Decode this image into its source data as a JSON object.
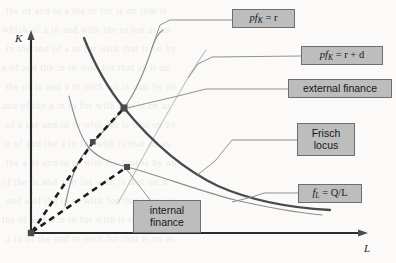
{
  "figure": {
    "name": "frisch-locus-diagram",
    "axes": {
      "y_label": "K",
      "x_label": "L",
      "y_title": "capital",
      "x_title": "labour"
    },
    "labels": {
      "pfk_r": {
        "lead": "pf",
        "sub": "K",
        "rest": " = r"
      },
      "pfk_r_plus_d": {
        "lead": "pf",
        "sub": "K",
        "rest": " = r + d"
      },
      "external_finance": "external finance",
      "frisch_locus_line1": "Frisch",
      "frisch_locus_line2": "locus",
      "fl_ql": {
        "lead": "f",
        "sub": "L",
        "rest": " = Q/L"
      },
      "internal_finance_line1": "internal",
      "internal_finance_line2": "finance"
    },
    "colors": {
      "box_fill": "#bdbdbd",
      "box_border": "#6e6e6e",
      "axis": "#2b2b2b",
      "curve_thick": "#4a4a4a",
      "curve_thin": "#8c8c8c",
      "curve_faint": "#c2c2c2",
      "ray_dashed": "#1d1d1d",
      "background": "#fbfaf8"
    },
    "nodes": [
      {
        "name": "external-finance-point",
        "x": 124,
        "y": 108
      },
      {
        "name": "mid-crossing-point",
        "x": 93,
        "y": 142
      },
      {
        "name": "internal-finance-point",
        "x": 127,
        "y": 167
      },
      {
        "name": "origin-point",
        "x": 31,
        "y": 233
      }
    ]
  },
  "chart_data": {
    "type": "line",
    "title": "",
    "xlabel": "L",
    "ylabel": "K",
    "grid": false,
    "legend": "callout-boxes",
    "xlim": [
      0,
      396
    ],
    "ylim": [
      0,
      263
    ],
    "series": [
      {
        "name": "Frisch locus",
        "style": "thick-dark",
        "note": "downward-sloping convex isoquant-like curve through external finance point",
        "points": [
          [
            84,
            38
          ],
          [
            95,
            56
          ],
          [
            108,
            80
          ],
          [
            124,
            108
          ],
          [
            142,
            133
          ],
          [
            165,
            156
          ],
          [
            196,
            176
          ],
          [
            235,
            192
          ],
          [
            280,
            203
          ],
          [
            330,
            209
          ]
        ]
      },
      {
        "name": "pf_K = r",
        "style": "thin-grey",
        "note": "upward S-shaped curve rising to upper right",
        "points": [
          [
            65,
            205
          ],
          [
            72,
            180
          ],
          [
            80,
            158
          ],
          [
            92,
            143
          ],
          [
            108,
            126
          ],
          [
            124,
            108
          ],
          [
            137,
            86
          ],
          [
            148,
            62
          ],
          [
            154,
            40
          ],
          [
            163,
            31
          ]
        ]
      },
      {
        "name": "pf_K = r + d",
        "style": "faint-grey",
        "note": "faint upward curve to the right of pf_K = r",
        "points": [
          [
            118,
            203
          ],
          [
            131,
            178
          ],
          [
            146,
            152
          ],
          [
            160,
            128
          ],
          [
            174,
            104
          ],
          [
            188,
            80
          ],
          [
            199,
            62
          ],
          [
            206,
            50
          ]
        ]
      },
      {
        "name": "f_L = Q/L",
        "style": "thin-grey",
        "note": "lower downward-sloping curve through internal finance point",
        "points": [
          [
            69,
            96
          ],
          [
            82,
            126
          ],
          [
            97,
            150
          ],
          [
            115,
            162
          ],
          [
            127,
            167
          ],
          [
            155,
            181
          ],
          [
            190,
            193
          ],
          [
            232,
            202
          ],
          [
            275,
            210
          ],
          [
            320,
            215
          ]
        ]
      },
      {
        "name": "internal finance ray",
        "style": "dashed",
        "note": "dashed ray from origin to internal finance point",
        "points": [
          [
            31,
            233
          ],
          [
            127,
            167
          ]
        ]
      },
      {
        "name": "external finance ray",
        "style": "dashed",
        "note": "dashed ray from origin through mid crossing to external finance point",
        "points": [
          [
            31,
            233
          ],
          [
            93,
            142
          ],
          [
            124,
            108
          ]
        ]
      }
    ]
  },
  "background_text": {
    "note": "faint show-through text from reverse of scanned page",
    "lines": [
      "the  of  and  in  a  the  to  for  is  on  that  it",
      "which  of  a  in  and  with  the  to  but  as  an",
      "in  the  and  of  a  to  for  with  that  is  on  by",
      "a  of  and  the  in  to  with  for  that  as  it  on",
      "the  of  in  and  a  to  with  for  is  that  by  on",
      "and  of  the  a  in  to  for  with  that  is  on  as",
      "of  a  the  and  in  to  with  for  is  that  on  by",
      "in  of  and  the  a  to  for  with  is  that  on  as",
      "the  a  of  and  in  to  with  for  that  is  by  on",
      "of  the  in  and  a  to  for  with  is  that  on  it",
      "and  a  of  the  in  to  with  for  that  is  on  as",
      "the  of  and  a  in  to  for  with  is  that  by  on",
      "a  in  of  the  and  to  with  for  that  is  on  as"
    ]
  }
}
